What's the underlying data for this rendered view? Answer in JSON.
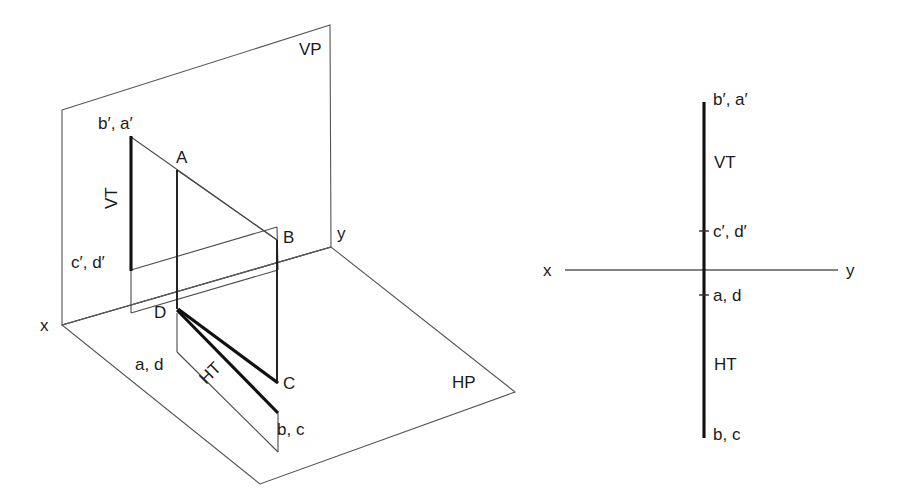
{
  "figure": {
    "kind": "engineering-drawing"
  },
  "pictorial": {
    "name": "pictorial-view",
    "planes": {
      "vp_label": "VP",
      "hp_label": "HP"
    },
    "axes": {
      "x_label": "x",
      "y_label": "y"
    },
    "traces": {
      "vt_label": "VT",
      "ht_label": "HT"
    },
    "points": [
      {
        "id": "ba-prime",
        "label": "b′, a′"
      },
      {
        "id": "A",
        "label": "A"
      },
      {
        "id": "B",
        "label": "B"
      },
      {
        "id": "cd-prime",
        "label": "c′, d′"
      },
      {
        "id": "D",
        "label": "D"
      },
      {
        "id": "C",
        "label": "C"
      },
      {
        "id": "ad",
        "label": "a, d"
      },
      {
        "id": "bc",
        "label": "b, c"
      }
    ]
  },
  "orthographic": {
    "name": "orthographic-view",
    "axes": {
      "x_label": "x",
      "y_label": "y"
    },
    "traces": {
      "vt_label": "VT",
      "ht_label": "HT"
    },
    "points": [
      {
        "id": "ba-prime",
        "label": "b′, a′"
      },
      {
        "id": "cd-prime",
        "label": "c′, d′"
      },
      {
        "id": "ad",
        "label": "a, d"
      },
      {
        "id": "bc",
        "label": "b, c"
      }
    ]
  },
  "colors": {
    "background": "#ffffff",
    "thin_line": "#545454",
    "thick_line": "#111111",
    "text": "#1b1b1b"
  }
}
